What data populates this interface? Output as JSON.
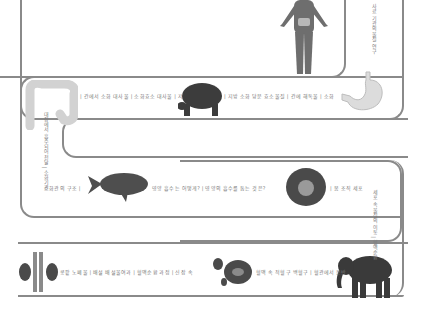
{
  "diagram": {
    "title": "",
    "type": "winding-path-infographic",
    "stations": [
      {
        "name": "human-body",
        "position": "top-right"
      },
      {
        "name": "stomach",
        "position": "right-row1"
      },
      {
        "name": "tortoise",
        "position": "middle-row1"
      },
      {
        "name": "large-intestine",
        "position": "left-row1"
      },
      {
        "name": "fish",
        "position": "left-row2"
      },
      {
        "name": "cell",
        "position": "right-row2"
      },
      {
        "name": "elephant",
        "position": "right-row3"
      },
      {
        "name": "blood-cells",
        "position": "middle-row3"
      },
      {
        "name": "kidneys",
        "position": "left-row3"
      }
    ],
    "labels": {
      "row1_left": "| 간에서 소화 대사물 | 소화효소 대사물 | 저",
      "row1_right": "| 지방 소화 당분 효소물질 | 간에 해독물 | 소화",
      "vertical_right_top": "사료 기관의 물질 연구",
      "vertical_left": "대장에서 흡수되어 전달 | 소화기관",
      "row2_left": "소화관의 구조 |",
      "row2_mid": "영양 흡수는 어떻게? | 영양의 흡수를 돕는 것은?",
      "row2_right": "| 몸 조직 세포",
      "vertical_right_mid": "세포 속 물질의 이동 | 혈액순환",
      "row3_left": "콩팥 노폐물 | 배설 배설물여과 | 혈액순환 과정 | 신장 속",
      "row3_right": "혈액 속 적혈구 백혈구 | 혈관에서 운반"
    }
  },
  "colors": {
    "track": "#8a8a8a",
    "text": "#7a7a7a",
    "body_figure": "#6e6e6e",
    "organ_light": "#d9d9d9",
    "animal_dark": "#3c3c3c",
    "cell_outer": "#4a4a4a",
    "cell_inner": "#9a9a9a"
  }
}
